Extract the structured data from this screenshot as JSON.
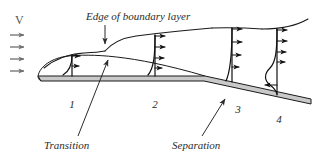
{
  "figure": {
    "background_color": "#ffffff",
    "ink_color": "#1a1a1a",
    "body_fill_color": "#c9c9c9",
    "freestream_color": "#6e6e6e",
    "width": 322,
    "height": 162
  },
  "labels": {
    "freestream_symbol": "V",
    "edge_callout": "Edge of  boundary layer",
    "transition": "Transition",
    "separation": "Separation"
  },
  "stations": [
    {
      "id": "1",
      "label": "1",
      "type": "laminar",
      "arrow_count": 2,
      "reverse_flow": false
    },
    {
      "id": "2",
      "label": "2",
      "type": "turbulent",
      "arrow_count": 4,
      "reverse_flow": false
    },
    {
      "id": "3",
      "label": "3",
      "type": "separating",
      "arrow_count": 4,
      "reverse_flow": false
    },
    {
      "id": "4",
      "label": "4",
      "type": "separated",
      "arrow_count": 5,
      "reverse_flow": true
    }
  ],
  "freestream_arrows": {
    "count": 4,
    "direction": "right"
  },
  "annotations": {
    "edge_callout_points_to": "boundary-layer-edge",
    "transition_points_to": "transition-point",
    "separation_points_to": "separation-point"
  }
}
